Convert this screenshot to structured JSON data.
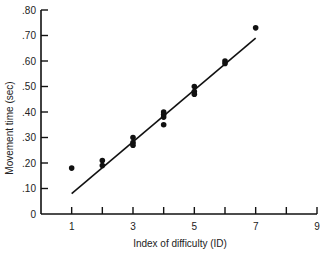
{
  "chart_data": {
    "type": "scatter",
    "title": "",
    "xlabel": "Index of difficulty (ID)",
    "ylabel": "Movement time (sec)",
    "xlim": [
      0,
      9
    ],
    "ylim": [
      0,
      0.8
    ],
    "x_ticks": [
      1,
      2,
      3,
      4,
      5,
      6,
      7,
      8,
      9
    ],
    "x_tick_labels": [
      "1",
      "",
      "3",
      "",
      "5",
      "",
      "7",
      "",
      "9"
    ],
    "y_ticks": [
      0,
      0.1,
      0.2,
      0.3,
      0.4,
      0.5,
      0.6,
      0.7,
      0.8
    ],
    "y_tick_labels": [
      "0",
      ".10",
      ".20",
      ".30",
      ".40",
      ".50",
      ".60",
      ".70",
      ".80"
    ],
    "grid": false,
    "legend": null,
    "series": [
      {
        "name": "observed",
        "kind": "scatter",
        "points": [
          {
            "x": 1,
            "y": 0.18
          },
          {
            "x": 2,
            "y": 0.21
          },
          {
            "x": 2,
            "y": 0.19
          },
          {
            "x": 3,
            "y": 0.3
          },
          {
            "x": 3,
            "y": 0.28
          },
          {
            "x": 3,
            "y": 0.27
          },
          {
            "x": 4,
            "y": 0.4
          },
          {
            "x": 4,
            "y": 0.39
          },
          {
            "x": 4,
            "y": 0.38
          },
          {
            "x": 4,
            "y": 0.35
          },
          {
            "x": 5,
            "y": 0.5
          },
          {
            "x": 5,
            "y": 0.48
          },
          {
            "x": 5,
            "y": 0.47
          },
          {
            "x": 6,
            "y": 0.6
          },
          {
            "x": 6,
            "y": 0.59
          },
          {
            "x": 7,
            "y": 0.73
          }
        ]
      },
      {
        "name": "regression fit",
        "kind": "line",
        "points": [
          {
            "x": 1,
            "y": 0.08
          },
          {
            "x": 7,
            "y": 0.69
          }
        ]
      }
    ],
    "colors": {
      "ink": "#111111",
      "background": "#ffffff"
    }
  }
}
